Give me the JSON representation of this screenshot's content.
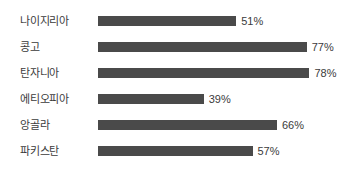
{
  "chart_data": {
    "type": "bar",
    "orientation": "horizontal",
    "title": "",
    "subtitle": "",
    "xlabel": "",
    "ylabel": "",
    "grid": false,
    "legend": false,
    "axis_visible": false,
    "value_suffix": "%",
    "xlim": [
      0,
      100
    ],
    "categories": [
      "나이지리아",
      "콩고",
      "탄자니아",
      "에티오피아",
      "앙골라",
      "파키스탄"
    ],
    "values": [
      51,
      77,
      78,
      39,
      66,
      57
    ],
    "value_labels": [
      "51%",
      "77%",
      "78%",
      "39%",
      "66%",
      "57%"
    ],
    "colors": {
      "bar": "#4a4a4a",
      "background": "#ffffff",
      "text": "#3b3b3b"
    }
  }
}
